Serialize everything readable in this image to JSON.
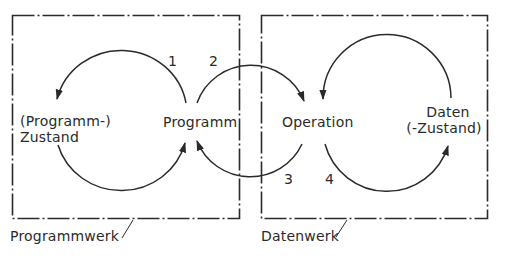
{
  "diagram": {
    "type": "block-flow",
    "colors": {
      "line": "#2a2a2a",
      "background": "#ffffff"
    },
    "boxes": [
      {
        "id": "programmwerk",
        "label": "Programmwerk",
        "border": "dash-dot"
      },
      {
        "id": "datenwerk",
        "label": "Datenwerk",
        "border": "dash-dot"
      }
    ],
    "nodes": {
      "programm_zustand": {
        "line1": "(Programm-)",
        "line2": "Zustand"
      },
      "programm": {
        "label": "Programm"
      },
      "operation": {
        "label": "Operation"
      },
      "daten_zustand": {
        "line1": "Daten",
        "line2": "(-Zustand)"
      }
    },
    "steps": [
      {
        "label": "1",
        "from": "Programm",
        "to": "(Programm-) Zustand"
      },
      {
        "label": "2",
        "from": "Programm",
        "to": "Operation"
      },
      {
        "label": "3",
        "from": "Operation",
        "to": "Programm"
      },
      {
        "label": "4",
        "from": "Operation",
        "to": "Daten (-Zustand)"
      }
    ]
  }
}
